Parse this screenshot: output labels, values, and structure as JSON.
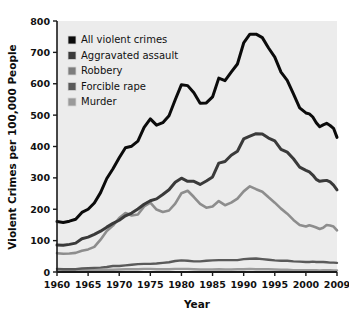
{
  "chart_data": {
    "type": "line",
    "title": "",
    "xlabel": "Year",
    "ylabel": "Violent Crimes per 100,000 People",
    "xlim": [
      1960,
      2009
    ],
    "ylim": [
      0,
      800
    ],
    "grid": false,
    "legend_position": "top-left",
    "xticks": [
      "1960",
      "1965",
      "1970",
      "1975",
      "1980",
      "1985",
      "1990",
      "1995",
      "2000",
      "2009"
    ],
    "xtick_values": [
      1960,
      1965,
      1970,
      1975,
      1980,
      1985,
      1990,
      1995,
      2000,
      2009
    ],
    "yticks": [
      "0",
      "100",
      "200",
      "300",
      "400",
      "500",
      "600",
      "700",
      "800"
    ],
    "ytick_values": [
      0,
      100,
      200,
      300,
      400,
      500,
      600,
      700,
      800
    ],
    "x": [
      1960,
      1961,
      1962,
      1963,
      1964,
      1965,
      1966,
      1967,
      1968,
      1969,
      1970,
      1971,
      1972,
      1973,
      1974,
      1975,
      1976,
      1977,
      1978,
      1979,
      1980,
      1981,
      1982,
      1983,
      1984,
      1985,
      1986,
      1987,
      1988,
      1989,
      1990,
      1991,
      1992,
      1993,
      1994,
      1995,
      1996,
      1997,
      1998,
      1999,
      2000,
      2001,
      2002,
      2003,
      2004,
      2005,
      2006,
      2007,
      2008,
      2009
    ],
    "series": [
      {
        "name": "All violent crimes",
        "color": "#0b0b0b",
        "width": 3.0,
        "values": [
          161,
          158,
          162,
          168,
          190,
          200,
          220,
          253,
          298,
          329,
          364,
          396,
          401,
          417,
          461,
          488,
          468,
          476,
          498,
          549,
          597,
          594,
          571,
          538,
          539,
          558,
          618,
          610,
          637,
          663,
          730,
          758,
          758,
          747,
          714,
          685,
          637,
          611,
          568,
          523,
          507,
          504,
          494,
          476,
          463,
          469,
          474,
          467,
          458,
          429
        ]
      },
      {
        "name": "Aggravated assault",
        "color": "#3a3a3a",
        "width": 3.0,
        "values": [
          86,
          85,
          88,
          92,
          106,
          111,
          120,
          130,
          143,
          155,
          165,
          179,
          188,
          201,
          216,
          227,
          233,
          247,
          262,
          286,
          299,
          289,
          289,
          279,
          290,
          303,
          347,
          352,
          372,
          385,
          424,
          433,
          441,
          440,
          427,
          418,
          391,
          382,
          361,
          334,
          324,
          319,
          309,
          295,
          289,
          291,
          292,
          287,
          277,
          262
        ]
      },
      {
        "name": "Robbery",
        "color": "#8d8d8d",
        "width": 2.6,
        "values": [
          60,
          58,
          59,
          61,
          68,
          72,
          80,
          103,
          131,
          148,
          172,
          188,
          180,
          183,
          209,
          221,
          199,
          191,
          196,
          218,
          251,
          259,
          239,
          217,
          205,
          209,
          226,
          213,
          221,
          234,
          257,
          273,
          264,
          256,
          238,
          221,
          202,
          186,
          166,
          150,
          145,
          149,
          146,
          142,
          137,
          141,
          150,
          148,
          145,
          133
        ]
      },
      {
        "name": "Forcible rape",
        "color": "#5a5a5a",
        "width": 2.4,
        "values": [
          10,
          9,
          9,
          9,
          11,
          12,
          13,
          14,
          16,
          19,
          19,
          21,
          23,
          25,
          26,
          26,
          27,
          29,
          31,
          35,
          37,
          36,
          34,
          34,
          36,
          37,
          38,
          38,
          38,
          38,
          41,
          42,
          43,
          41,
          39,
          37,
          36,
          36,
          34,
          33,
          32,
          32,
          33,
          32,
          32,
          32,
          31,
          30,
          30,
          29
        ]
      },
      {
        "name": "Murder",
        "color": "#9a9a9a",
        "width": 2.4,
        "values": [
          5,
          5,
          5,
          5,
          5,
          5,
          6,
          6,
          7,
          7,
          8,
          9,
          9,
          9,
          10,
          10,
          9,
          9,
          9,
          10,
          10,
          10,
          9,
          8,
          8,
          8,
          9,
          8,
          8,
          9,
          9,
          10,
          9,
          9,
          9,
          8,
          7,
          7,
          6,
          6,
          6,
          6,
          6,
          6,
          5,
          6,
          6,
          6,
          5,
          5
        ]
      }
    ]
  },
  "legend": {
    "entries": [
      {
        "label": "All violent crimes",
        "swatch": "#0b0b0b"
      },
      {
        "label": "Aggravated assault",
        "swatch": "#3a3a3a"
      },
      {
        "label": "Robbery",
        "swatch": "#7d7d7d"
      },
      {
        "label": "Forcible rape",
        "swatch": "#5a5a5a"
      },
      {
        "label": "Murder",
        "swatch": "#9a9a9a"
      }
    ]
  },
  "style": {
    "plot_background": "#ececec",
    "page_background": "#ffffff",
    "axis_color": "#1a1a1a",
    "text_color": "#111111"
  }
}
